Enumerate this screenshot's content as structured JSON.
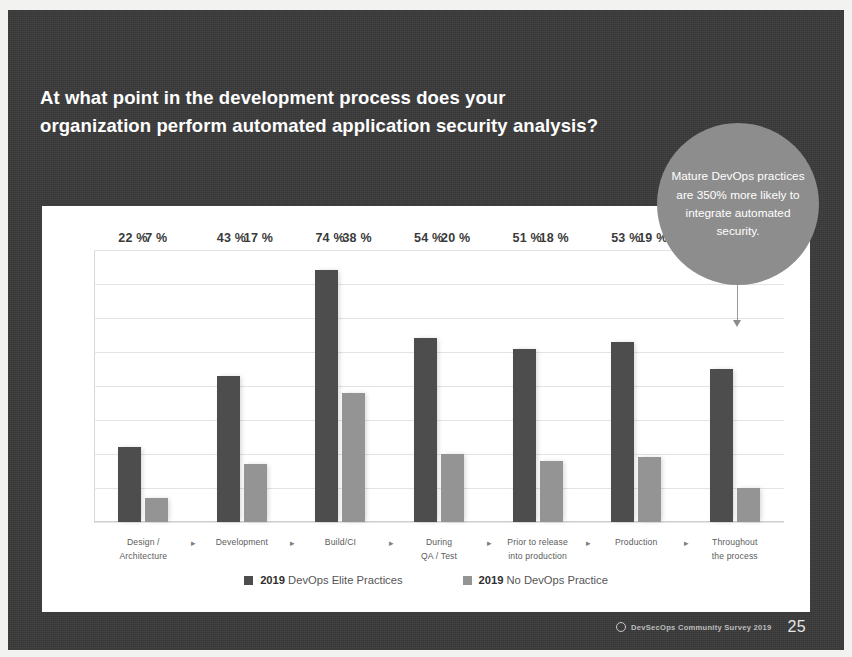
{
  "slide": {
    "title_lines": [
      "At what point in the development process does your",
      "organization perform automated application security analysis?"
    ],
    "callout_text": "Mature DevOps practices are 350% more likely to integrate automated security."
  },
  "footer": {
    "brand_icon": "ring-icon",
    "brand": "DevSecOps Community Survey 2019",
    "page": "25"
  },
  "legend": {
    "items": [
      {
        "year": "2019",
        "label": " DevOps Elite Practices",
        "color": "#4d4d4d",
        "swatch_icon": "square-swatch-icon"
      },
      {
        "year": "2019",
        "label": " No DevOps Practice",
        "color": "#949494",
        "swatch_icon": "square-swatch-icon"
      }
    ]
  },
  "axis": {
    "arrow_glyph": "▸",
    "categories": [
      [
        "Design /",
        "Architecture"
      ],
      [
        "Development",
        ""
      ],
      [
        "Build/CI",
        ""
      ],
      [
        "During",
        "QA / Test"
      ],
      [
        "Prior to release",
        "into production"
      ],
      [
        "Production",
        ""
      ],
      [
        "Throughout",
        "the process"
      ]
    ]
  },
  "chart_data": {
    "type": "bar",
    "title": "At what point in the development process does your organization perform automated application security analysis?",
    "xlabel": "",
    "ylabel": "",
    "ylim": [
      0,
      80
    ],
    "grid": true,
    "grid_step": 10,
    "legend_position": "bottom",
    "value_suffix": "%",
    "categories": [
      "Design / Architecture",
      "Development",
      "Build/CI",
      "During QA / Test",
      "Prior to release into production",
      "Production",
      "Throughout the process"
    ],
    "series": [
      {
        "name": "2019 DevOps Elite Practices",
        "color": "#4d4d4d",
        "values": [
          22,
          43,
          74,
          54,
          51,
          53,
          45
        ],
        "labels": [
          "22 %",
          "43 %",
          "74 %",
          "54 %",
          "51 %",
          "53 %",
          "45 %"
        ]
      },
      {
        "name": "2019 No DevOps Practice",
        "color": "#949494",
        "values": [
          7,
          17,
          38,
          20,
          18,
          19,
          10
        ],
        "labels": [
          "7 %",
          "17 %",
          "38 %",
          "20 %",
          "18 %",
          "19 %",
          "10 %"
        ]
      }
    ],
    "annotations": [
      {
        "text": "Mature DevOps practices are 350% more likely to integrate automated security.",
        "points_to_category": "Throughout the process",
        "points_to_series": "2019 DevOps Elite Practices"
      }
    ]
  }
}
